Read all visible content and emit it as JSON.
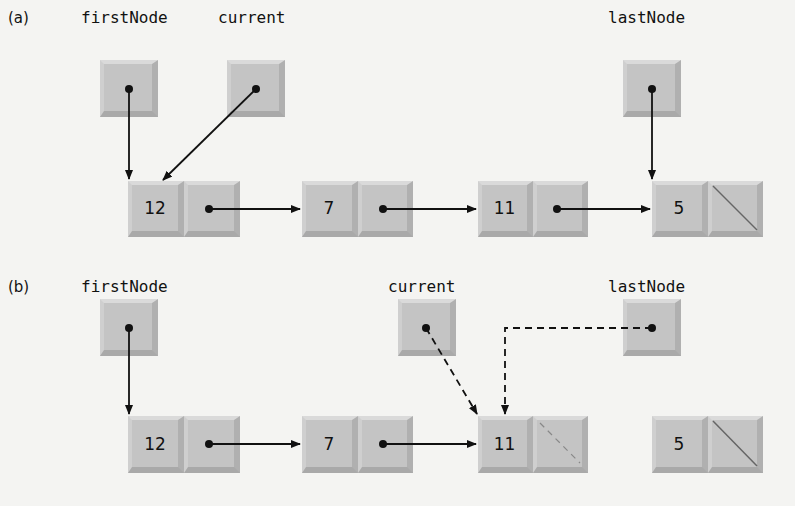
{
  "panel_a": {
    "label": "(a)",
    "refs": {
      "first": "firstNode",
      "current": "current",
      "last": "lastNode"
    },
    "nodes": [
      "12",
      "7",
      "11",
      "5"
    ]
  },
  "panel_b": {
    "label": "(b)",
    "refs": {
      "first": "firstNode",
      "current": "current",
      "last": "lastNode"
    },
    "nodes": [
      "12",
      "7",
      "11",
      "5"
    ]
  },
  "colors": {
    "box": "#c4c4c4",
    "line": "#111111",
    "background": "#f4f4f2"
  }
}
